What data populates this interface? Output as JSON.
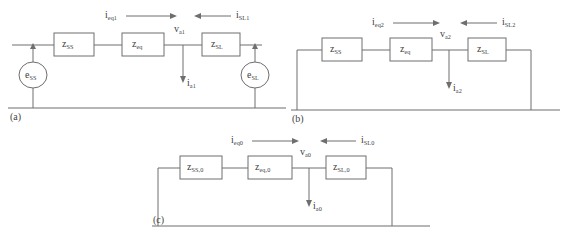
{
  "figure": {
    "background_color": "#ffffff",
    "line_color": "#6e6e6e",
    "text_color": "#404040",
    "panels": [
      {
        "id": "a",
        "caption": "(a)",
        "type": "positive-sequence-network",
        "has_sources": true,
        "boxes": [
          {
            "name": "z-ss-box",
            "base": "z",
            "sub": "SS"
          },
          {
            "name": "z-eq-box",
            "base": "z",
            "sub": "eq"
          },
          {
            "name": "z-sl-box",
            "base": "z",
            "sub": "SL"
          }
        ],
        "sources": [
          {
            "name": "e-ss-source",
            "base": "e",
            "sub": "SS"
          },
          {
            "name": "e-sl-source",
            "base": "e",
            "sub": "SL"
          }
        ],
        "currents": [
          {
            "name": "i-eq1-label",
            "base": "i",
            "sub": "eq1",
            "direction": "right"
          },
          {
            "name": "i-sl1-label",
            "base": "i",
            "sub": "SL1",
            "direction": "left"
          },
          {
            "name": "i-a1-label",
            "base": "i",
            "sub": "a1",
            "direction": "down"
          }
        ],
        "node": {
          "name": "v-a1-label",
          "base": "v",
          "sub": "a1"
        }
      },
      {
        "id": "b",
        "caption": "(b)",
        "type": "negative-sequence-network",
        "has_sources": false,
        "boxes": [
          {
            "name": "z-ss-box",
            "base": "z",
            "sub": "SS"
          },
          {
            "name": "z-eq-box",
            "base": "z",
            "sub": "eq"
          },
          {
            "name": "z-sl-box",
            "base": "z",
            "sub": "SL"
          }
        ],
        "sources": [],
        "currents": [
          {
            "name": "i-eq2-label",
            "base": "i",
            "sub": "eq2",
            "direction": "right"
          },
          {
            "name": "i-sl2-label",
            "base": "i",
            "sub": "SL2",
            "direction": "left"
          },
          {
            "name": "i-a2-label",
            "base": "i",
            "sub": "a2",
            "direction": "down"
          }
        ],
        "node": {
          "name": "v-a2-label",
          "base": "v",
          "sub": "a2"
        }
      },
      {
        "id": "c",
        "caption": "(c)",
        "type": "zero-sequence-network",
        "has_sources": false,
        "boxes": [
          {
            "name": "z-ss-0-box",
            "base": "z",
            "sub": "SS,0"
          },
          {
            "name": "z-eq-0-box",
            "base": "z",
            "sub": "eq,0"
          },
          {
            "name": "z-sl-0-box",
            "base": "z",
            "sub": "SL,0"
          }
        ],
        "sources": [],
        "currents": [
          {
            "name": "i-eq0-label",
            "base": "i",
            "sub": "eq0",
            "direction": "right"
          },
          {
            "name": "i-sl0-label",
            "base": "i",
            "sub": "SL0",
            "direction": "left"
          },
          {
            "name": "i-a0-label",
            "base": "i",
            "sub": "a0",
            "direction": "down"
          }
        ],
        "node": {
          "name": "v-a0-label",
          "base": "v",
          "sub": "a0"
        }
      }
    ]
  }
}
